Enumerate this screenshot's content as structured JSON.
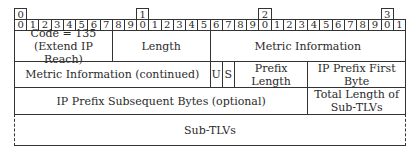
{
  "header": {
    "word_indices": [
      {
        "label": "0",
        "bit": 0
      },
      {
        "label": "1",
        "bit": 10
      },
      {
        "label": "2",
        "bit": 20
      },
      {
        "label": "3",
        "bit": 30
      }
    ],
    "bits": [
      "0",
      "1",
      "2",
      "3",
      "4",
      "5",
      "6",
      "7",
      "8",
      "9",
      "0",
      "1",
      "2",
      "3",
      "4",
      "5",
      "6",
      "7",
      "8",
      "9",
      "0",
      "1",
      "2",
      "3",
      "4",
      "5",
      "6",
      "7",
      "8",
      "9",
      "0",
      "1"
    ]
  },
  "fields": [
    {
      "id": "code",
      "label": "Code = 135\n(Extend IP Reach)",
      "row": 0,
      "start": 0,
      "end": 8
    },
    {
      "id": "length",
      "label": "Length",
      "row": 0,
      "start": 8,
      "end": 16
    },
    {
      "id": "metric",
      "label": "Metric Information",
      "row": 0,
      "start": 16,
      "end": 32
    },
    {
      "id": "metric_cont",
      "label": "Metric Information (continued)",
      "row": 1,
      "start": 0,
      "end": 16
    },
    {
      "id": "u",
      "label": "U",
      "row": 1,
      "start": 16,
      "end": 17
    },
    {
      "id": "s",
      "label": "S",
      "row": 1,
      "start": 17,
      "end": 18
    },
    {
      "id": "prefix_length",
      "label": "Prefix Length",
      "row": 1,
      "start": 18,
      "end": 24
    },
    {
      "id": "prefix_first",
      "label": "IP Prefix First Byte",
      "row": 1,
      "start": 24,
      "end": 32
    },
    {
      "id": "prefix_subseq",
      "label": "IP Prefix Subsequent Bytes (optional)",
      "row": 2,
      "start": 0,
      "end": 24
    },
    {
      "id": "total_len",
      "label": "Total Length of\nSub-TLVs",
      "row": 2,
      "start": 24,
      "end": 32
    },
    {
      "id": "sub_tlvs",
      "label": "Sub-TLVs",
      "row": 3,
      "start": 0,
      "end": 32
    }
  ]
}
